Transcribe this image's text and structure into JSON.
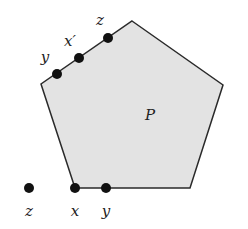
{
  "diagram": {
    "polygon": {
      "label": "P",
      "fill": "#e3e3e3",
      "stroke": "#2a2a2a",
      "vertices": [
        [
          132,
          21
        ],
        [
          223,
          85
        ],
        [
          190,
          188
        ],
        [
          75,
          188
        ],
        [
          41,
          84
        ]
      ]
    },
    "points": [
      {
        "name": "y-upper",
        "label": "y",
        "x": 57,
        "y": 74,
        "lx": 45,
        "ly": 62
      },
      {
        "name": "x-prime",
        "label": "x′",
        "x": 79,
        "y": 58,
        "lx": 70,
        "ly": 46
      },
      {
        "name": "z-upper",
        "label": "z",
        "x": 108,
        "y": 38,
        "lx": 100,
        "ly": 25
      },
      {
        "name": "z-lower",
        "label": "z",
        "x": 29,
        "y": 188,
        "lx": 29,
        "ly": 216
      },
      {
        "name": "x-lower",
        "label": "x",
        "x": 75,
        "y": 188,
        "lx": 75,
        "ly": 216
      },
      {
        "name": "y-lower",
        "label": "y",
        "x": 106,
        "y": 188,
        "lx": 106,
        "ly": 216
      }
    ],
    "point_color": "#111111"
  }
}
